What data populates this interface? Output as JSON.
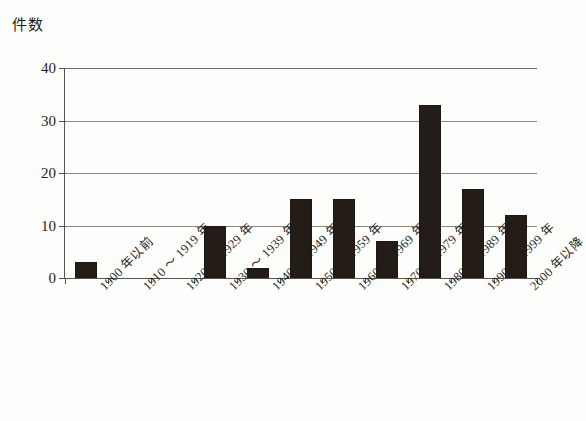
{
  "chart_data": {
    "type": "bar",
    "title": "",
    "ylabel": "件数",
    "xlabel": "",
    "ylim": [
      0,
      40
    ],
    "yticks": [
      0,
      10,
      20,
      30,
      40
    ],
    "grid": true,
    "legend": false,
    "categories": [
      "1900 年以前",
      "1910 ～ 1919 年",
      "1920 ～ 1929 年",
      "1930 ～ 1939 年",
      "1940 ～ 1949 年",
      "1950 ～ 1959 年",
      "1960 ～ 1969 年",
      "1970 ～ 1979 年",
      "1980 ～ 1989 年",
      "1990 ～ 1999 年",
      "2000 年以降"
    ],
    "values": [
      3,
      0,
      0,
      10,
      2,
      15,
      15,
      7,
      33,
      17,
      12
    ],
    "bar_color": "#241c16",
    "grid_color": "#8a8a84",
    "axis_color": "#55554f",
    "background_color": "#fdfdfb"
  }
}
